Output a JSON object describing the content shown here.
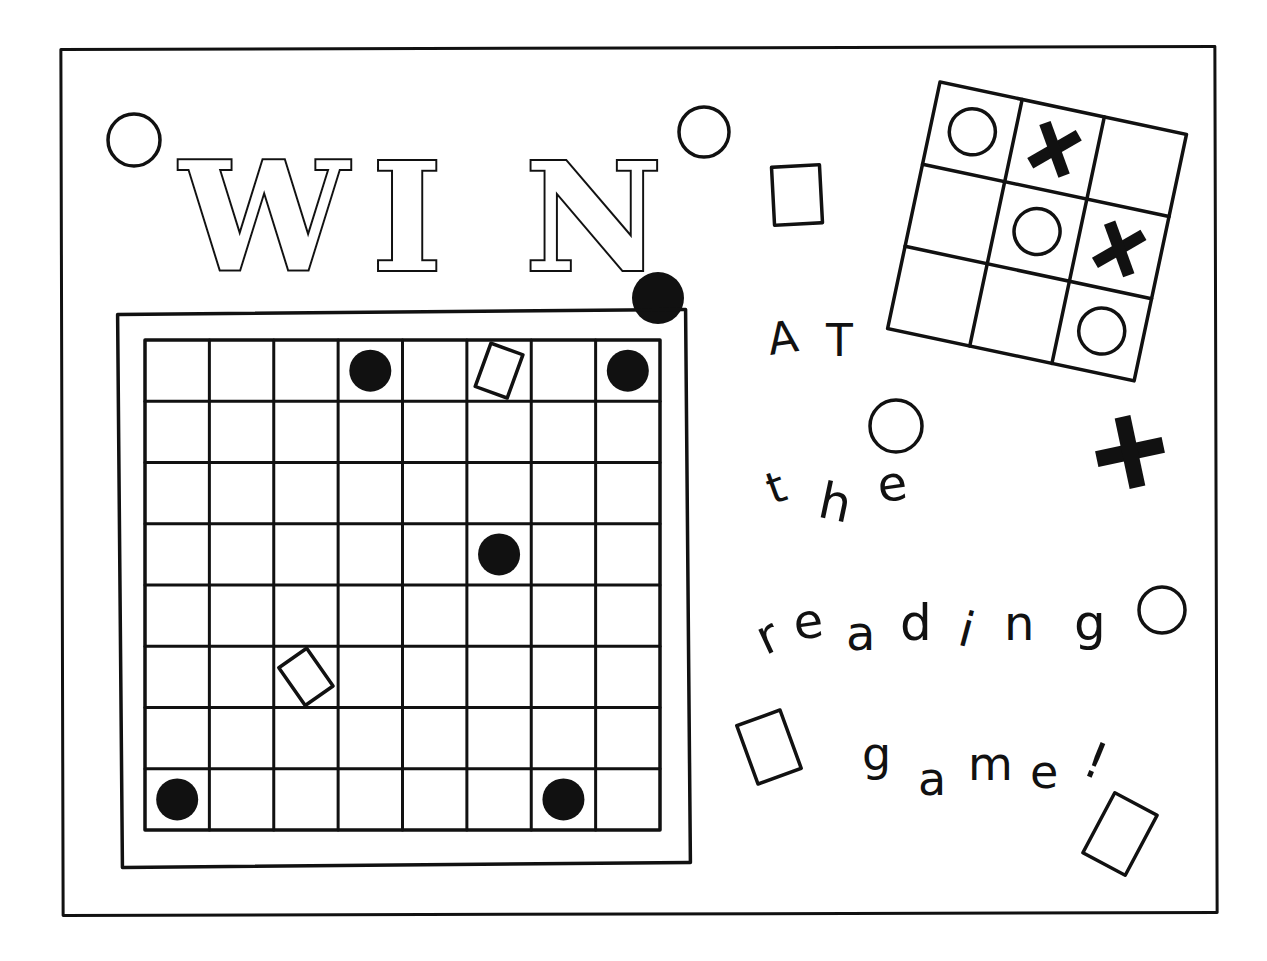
{
  "title": {
    "letters": [
      "W",
      "I",
      "N"
    ]
  },
  "slogan": {
    "line1": [
      "A",
      "T"
    ],
    "line2": [
      "t",
      "h",
      "e"
    ],
    "line3": [
      "r",
      "e",
      "a",
      "d",
      "i",
      "n",
      "g"
    ],
    "line4": [
      "g",
      "a",
      "m",
      "e",
      "!"
    ],
    "full_text": "WIN AT the reading game!"
  },
  "checkerboard": {
    "rows": 8,
    "cols": 8,
    "pieces": [
      {
        "type": "black-disc",
        "row": 0,
        "col": 3
      },
      {
        "type": "white-square",
        "row": 0,
        "col": 5
      },
      {
        "type": "black-disc",
        "row": 0,
        "col": 7
      },
      {
        "type": "black-disc",
        "row": 3,
        "col": 5
      },
      {
        "type": "white-square",
        "row": 5,
        "col": 2
      },
      {
        "type": "black-disc",
        "row": 7,
        "col": 0
      },
      {
        "type": "black-disc",
        "row": 7,
        "col": 6
      }
    ]
  },
  "tictactoe": {
    "cells": [
      [
        "O",
        "X",
        ""
      ],
      [
        "",
        "O",
        "X"
      ],
      [
        "",
        "",
        "O"
      ]
    ]
  },
  "colors": {
    "ink": "#111111",
    "paper": "#ffffff"
  }
}
